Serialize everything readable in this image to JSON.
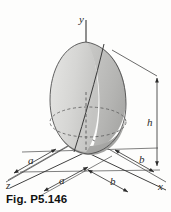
{
  "figure": {
    "caption": "Fig. P5.146",
    "axes": {
      "y_label": "y",
      "x_label": "x",
      "z_label": "z"
    },
    "dimensions": {
      "a_left": "a",
      "a_front": "a",
      "b_right": "b",
      "b_front": "b",
      "h_height": "h"
    },
    "colors": {
      "background": "#fdfdfc",
      "line": "#2b2b2b",
      "solid_light": "#d8d8d6",
      "solid_mid": "#c2c2c0",
      "solid_dark": "#a9a9a7",
      "solid_base": "#b5b5b3",
      "grid_line": "#4a4a4a"
    },
    "solid": {
      "description": "half-ellipsoid solid with oblique cutting plane"
    }
  }
}
